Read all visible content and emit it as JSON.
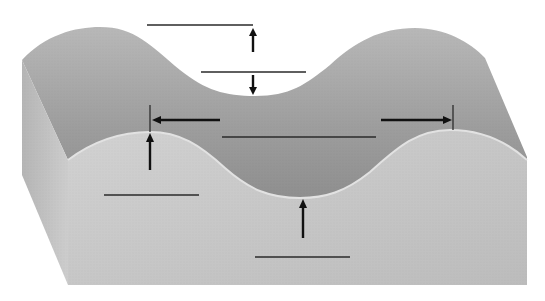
{
  "diagram": {
    "title": "",
    "colors": {
      "background": "#ffffff",
      "top_surface": "#a9a9a9",
      "top_surface_dark": "#949494",
      "front_face": "#c6c6c6",
      "side_face": "#bdbdbd",
      "lines": "#222222"
    },
    "labels": [
      {
        "id": "crest-label",
        "text": "",
        "x1": 147,
        "y1": 25,
        "x2": 253,
        "y2": 25
      },
      {
        "id": "trough-top-label",
        "text": "",
        "x1": 201,
        "y1": 72,
        "x2": 306,
        "y2": 72
      },
      {
        "id": "wavelength-label",
        "text": "",
        "x1": 222,
        "y1": 137,
        "x2": 376,
        "y2": 137
      },
      {
        "id": "crest-front-label",
        "text": "",
        "x1": 104,
        "y1": 195,
        "x2": 199,
        "y2": 195
      },
      {
        "id": "trough-front-label",
        "text": "",
        "x1": 255,
        "y1": 257,
        "x2": 350,
        "y2": 257
      }
    ],
    "arrows": [
      {
        "id": "arrow-up-crest-top",
        "direction": "up",
        "x": 253,
        "y_from": 52,
        "y_to": 28
      },
      {
        "id": "arrow-down-trough-top",
        "direction": "down",
        "x": 253,
        "y_from": 75,
        "y_to": 95
      },
      {
        "id": "arrow-left-wavelength",
        "direction": "left",
        "y": 120,
        "x_from": 220,
        "x_to": 152
      },
      {
        "id": "arrow-right-wavelength",
        "direction": "right",
        "y": 120,
        "x_from": 381,
        "x_to": 452
      },
      {
        "id": "arrow-up-front-crest",
        "direction": "up",
        "x": 150,
        "y_from": 170,
        "y_to": 132
      },
      {
        "id": "arrow-up-front-trough",
        "direction": "up",
        "x": 303,
        "y_from": 238,
        "y_to": 198
      }
    ]
  }
}
